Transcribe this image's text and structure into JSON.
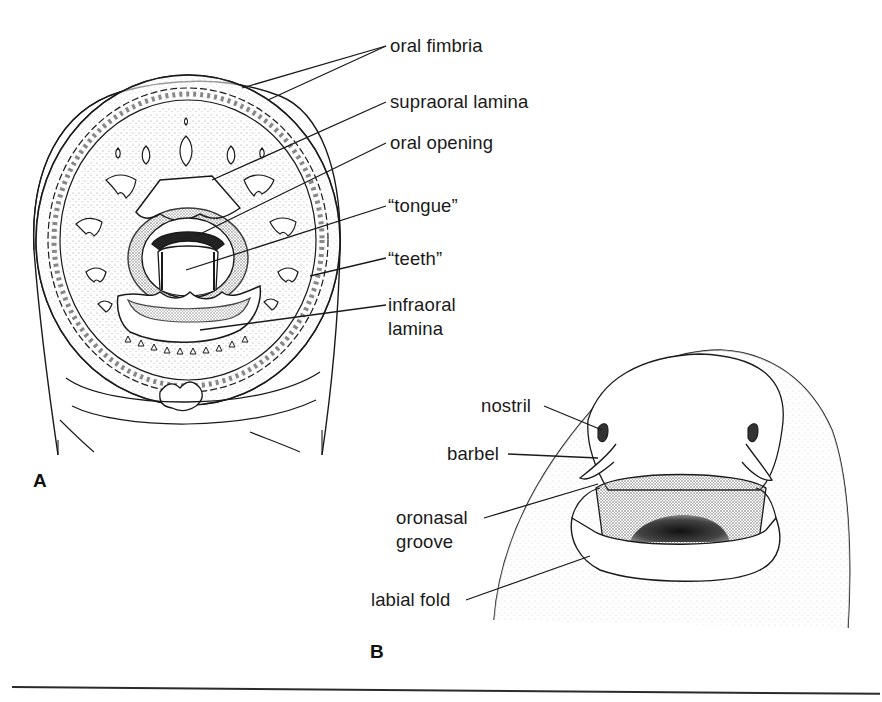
{
  "figure": {
    "panel_a": {
      "letter": "A",
      "subject": "lamprey oral disc, ventral view",
      "labels": [
        {
          "id": "oral-fimbria",
          "text": "oral fimbria"
        },
        {
          "id": "supraoral-lamina",
          "text": "supraoral lamina"
        },
        {
          "id": "oral-opening",
          "text": "oral opening"
        },
        {
          "id": "tongue",
          "text": "“tongue”"
        },
        {
          "id": "teeth",
          "text": "“teeth”"
        },
        {
          "id": "infraoral-lamina-line1",
          "text": "infraoral"
        },
        {
          "id": "infraoral-lamina-line2",
          "text": "lamina"
        }
      ]
    },
    "panel_b": {
      "letter": "B",
      "subject": "hagfish head, ventral view",
      "labels": [
        {
          "id": "nostril",
          "text": "nostril"
        },
        {
          "id": "barbel",
          "text": "barbel"
        },
        {
          "id": "oronasal-groove-line1",
          "text": "oronasal"
        },
        {
          "id": "oronasal-groove-line2",
          "text": "groove"
        },
        {
          "id": "labial-fold",
          "text": "labial fold"
        }
      ]
    },
    "colors": {
      "ink": "#1a1a1a",
      "stipple": "#9a9a9a",
      "background": "#ffffff"
    }
  }
}
